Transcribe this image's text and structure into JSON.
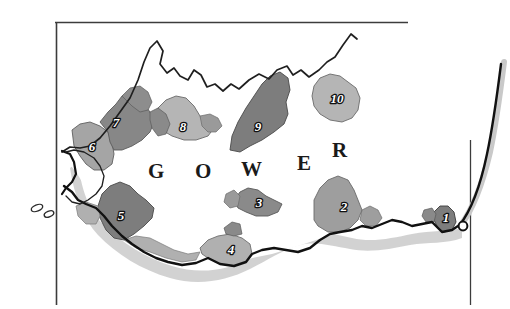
{
  "figure": {
    "title_wordmark": "GOWER",
    "wordmark_letters": [
      "G",
      "O",
      "W",
      "E",
      "R"
    ],
    "background_color": "#ffffff",
    "frame_color": "#3c3c3c",
    "coast_outline_color": "#111111",
    "shadow_color": "#c9c9c9"
  },
  "legend_colors": {
    "dark_grey": "#7d7d7d",
    "mid_grey": "#9e9e9e",
    "light_grey": "#b8b8b8",
    "pale_grey": "#cfcfcf",
    "label_text": "#ffffff",
    "label_outline": "#111111"
  },
  "regions": [
    {
      "id": 1,
      "label": "1",
      "shade": "#7d7d7d",
      "label_x": 446,
      "label_y": 222
    },
    {
      "id": 2,
      "label": "2",
      "shade": "#9e9e9e",
      "label_x": 344,
      "label_y": 211
    },
    {
      "id": 3,
      "label": "3",
      "shade": "#8a8a8a",
      "label_x": 259,
      "label_y": 207
    },
    {
      "id": 4,
      "label": "4",
      "shade": "#b0b0b0",
      "label_x": 231,
      "label_y": 252
    },
    {
      "id": 5,
      "label": "5",
      "shade": "#7d7d7d",
      "label_x": 121,
      "label_y": 215
    },
    {
      "id": 6,
      "label": "6",
      "shade": "#a5a5a5",
      "label_x": 92,
      "label_y": 146
    },
    {
      "id": 7,
      "label": "7",
      "shade": "#878787",
      "label_x": 114,
      "label_y": 122
    },
    {
      "id": 8,
      "label": "8",
      "shade": "#b5b5b5",
      "label_x": 183,
      "label_y": 128
    },
    {
      "id": 9,
      "label": "9",
      "shade": "#7d7d7d",
      "label_x": 258,
      "label_y": 126
    },
    {
      "id": 10,
      "label": "10",
      "shade": "#b5b5b5",
      "label_x": 336,
      "label_y": 98
    }
  ],
  "wordmark_positions": [
    {
      "letter": "G",
      "x": 148,
      "y": 178
    },
    {
      "letter": "O",
      "x": 195,
      "y": 178
    },
    {
      "letter": "W",
      "x": 243,
      "y": 175
    },
    {
      "letter": "E",
      "x": 298,
      "y": 169
    },
    {
      "letter": "R",
      "x": 334,
      "y": 155
    }
  ],
  "frame": {
    "top_line": {
      "x1": 55,
      "y1": 22,
      "x2": 408,
      "y2": 22
    },
    "left_line": {
      "x1": 56,
      "y1": 22,
      "x2": 56,
      "y2": 305
    },
    "right_line": {
      "x1": 470,
      "y1": 140,
      "x2": 470,
      "y2": 305
    }
  }
}
